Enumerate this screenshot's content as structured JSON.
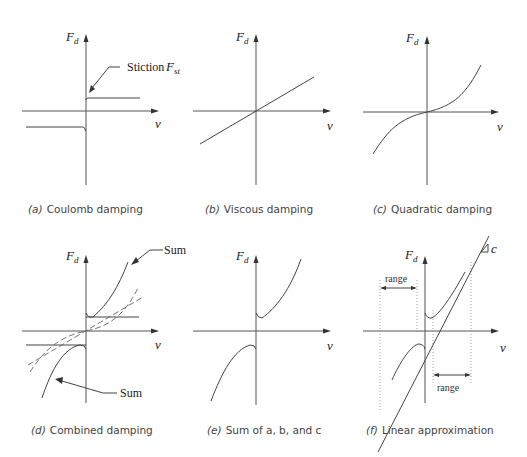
{
  "figure": {
    "panels": [
      {
        "id": "a",
        "caption_letter": "(a)",
        "caption_text": "Coulomb damping",
        "y_axis_label": "F",
        "y_axis_sub": "d",
        "x_axis_label": "v",
        "annotation": "Stiction",
        "annotation_symbol": "F",
        "annotation_sub": "st"
      },
      {
        "id": "b",
        "caption_letter": "(b)",
        "caption_text": "Viscous damping",
        "y_axis_label": "F",
        "y_axis_sub": "d",
        "x_axis_label": "v"
      },
      {
        "id": "c",
        "caption_letter": "(c)",
        "caption_text": "Quadratic damping",
        "y_axis_label": "F",
        "y_axis_sub": "d",
        "x_axis_label": "v"
      },
      {
        "id": "d",
        "caption_letter": "(d)",
        "caption_text": "Combined damping",
        "y_axis_label": "F",
        "y_axis_sub": "d",
        "x_axis_label": "v",
        "annotation_upper": "Sum",
        "annotation_lower": "Sum"
      },
      {
        "id": "e",
        "caption_letter": "(e)",
        "caption_text": "Sum of a, b, and c",
        "y_axis_label": "F",
        "y_axis_sub": "d",
        "x_axis_label": "v"
      },
      {
        "id": "f",
        "caption_letter": "(f)",
        "caption_text": "Linear approximation",
        "y_axis_label": "F",
        "y_axis_sub": "d",
        "x_axis_label": "v",
        "range_label_left": "range",
        "range_label_right": "range",
        "slope_label": "c"
      }
    ]
  }
}
